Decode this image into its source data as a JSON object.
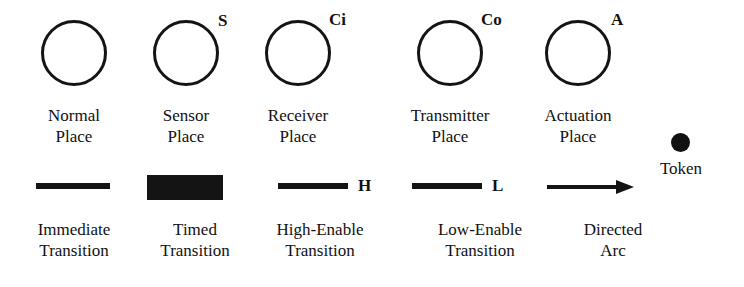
{
  "figure": {
    "kind": "petri-net-legend",
    "ink_color": "#141414",
    "background": "#ffffff"
  },
  "places": [
    {
      "id": "normal",
      "mark": "",
      "caption_line1": "Normal",
      "caption_line2": "Place"
    },
    {
      "id": "sensor",
      "mark": "S",
      "caption_line1": "Sensor",
      "caption_line2": "Place"
    },
    {
      "id": "receiver",
      "mark": "Ci",
      "caption_line1": "Receiver",
      "caption_line2": "Place"
    },
    {
      "id": "transmitter",
      "mark": "Co",
      "caption_line1": "Transmitter",
      "caption_line2": "Place"
    },
    {
      "id": "actuation",
      "mark": "A",
      "caption_line1": "Actuation",
      "caption_line2": "Place"
    }
  ],
  "token": {
    "caption_line1": "Token",
    "caption_line2": ""
  },
  "transitions": [
    {
      "id": "immediate",
      "mark": "",
      "caption_line1": "Immediate",
      "caption_line2": "Transition"
    },
    {
      "id": "timed",
      "mark": "",
      "caption_line1": "Timed",
      "caption_line2": "Transition"
    },
    {
      "id": "high-enable",
      "mark": "H",
      "caption_line1": "High-Enable",
      "caption_line2": "Transition"
    },
    {
      "id": "low-enable",
      "mark": "L",
      "caption_line1": "Low-Enable",
      "caption_line2": "Transition"
    },
    {
      "id": "directed-arc",
      "mark": "",
      "caption_line1": "Directed",
      "caption_line2": "Arc"
    }
  ]
}
